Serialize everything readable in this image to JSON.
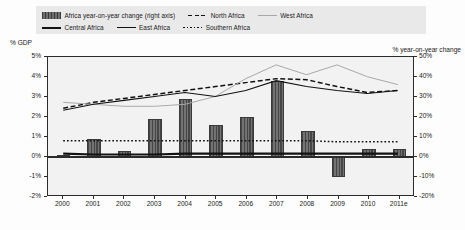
{
  "legend": {
    "rows": [
      [
        {
          "label": "Africa year-on-year change (right axis)",
          "key": "bar-swatch"
        },
        {
          "label": "North Africa",
          "key": "dashed-line"
        },
        {
          "label": "West Africa",
          "key": "light-solid-line"
        }
      ],
      [
        {
          "label": "Central Africa",
          "key": "thick-solid-line"
        },
        {
          "label": "East Africa",
          "key": "thin-solid-line"
        },
        {
          "label": "Southern Africa",
          "key": "dotted-line"
        }
      ]
    ]
  },
  "axes": {
    "left_caption": "% GDP",
    "right_caption": "% year-on-year change",
    "left_ticks": [
      "5%",
      "4%",
      "3%",
      "2%",
      "1%",
      "0%",
      "-1%",
      "-2%"
    ],
    "right_ticks": [
      "50%",
      "40%",
      "30%",
      "20%",
      "10%",
      "0%",
      "-10%",
      "-20%"
    ],
    "x_ticks": [
      "2000",
      "2001",
      "2002",
      "2003",
      "2004",
      "2005",
      "2006",
      "2007",
      "2008",
      "2009",
      "2010",
      "2011e"
    ]
  },
  "colors": {
    "bar": "#575757",
    "axis": "#2b2b2b",
    "plot_bg": "#f2f2f2",
    "legend_bg": "#e9e9e9",
    "dark_line": "#121212",
    "light_line": "#a8a8a8"
  },
  "chart_data": {
    "type": "line",
    "title": "",
    "xlabel": "",
    "ylabel": "% GDP",
    "y2label": "% year-on-year change",
    "grid": false,
    "legend_position": "top",
    "x": [
      "2000",
      "2001",
      "2002",
      "2003",
      "2004",
      "2005",
      "2006",
      "2007",
      "2008",
      "2009",
      "2010",
      "2011e"
    ],
    "ylim": [
      -2,
      5
    ],
    "y2lim": [
      -20,
      50
    ],
    "bar_series": {
      "name": "Africa year-on-year change (right axis)",
      "axis": "right",
      "values": [
        1,
        9,
        3,
        19,
        29,
        16,
        20,
        38,
        13,
        -10,
        4,
        4
      ]
    },
    "series": [
      {
        "name": "North Africa",
        "axis": "left",
        "style": "dashed",
        "color": "#121212",
        "values": [
          2.4,
          2.7,
          2.9,
          3.1,
          3.3,
          3.5,
          3.7,
          3.9,
          3.85,
          3.5,
          3.2,
          3.3
        ]
      },
      {
        "name": "West Africa",
        "axis": "left",
        "style": "light-solid",
        "color": "#a8a8a8",
        "values": [
          2.7,
          2.6,
          2.5,
          2.5,
          2.6,
          3.0,
          3.9,
          4.6,
          4.1,
          4.6,
          4.0,
          3.6
        ]
      },
      {
        "name": "Central Africa",
        "axis": "left",
        "style": "thick-solid",
        "color": "#121212",
        "values": [
          0.1,
          0.05,
          0.05,
          0.05,
          0.1,
          0.1,
          0.1,
          0.1,
          0.1,
          0.1,
          0.1,
          0.1
        ]
      },
      {
        "name": "East Africa",
        "axis": "left",
        "style": "thin-solid",
        "color": "#121212",
        "values": [
          2.3,
          2.6,
          2.8,
          3.0,
          3.2,
          3.0,
          3.3,
          3.8,
          3.5,
          3.3,
          3.15,
          3.3
        ]
      },
      {
        "name": "Southern Africa",
        "axis": "left",
        "style": "dotted",
        "color": "#121212",
        "values": [
          0.75,
          0.75,
          0.75,
          0.75,
          0.75,
          0.75,
          0.75,
          0.75,
          0.75,
          0.7,
          0.7,
          0.7
        ]
      }
    ]
  }
}
